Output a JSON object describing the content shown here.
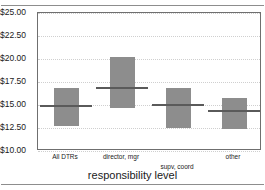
{
  "chart_data": {
    "type": "bar",
    "title": "",
    "xlabel": "responsibility level",
    "ylabel": "",
    "categories": [
      "All DTRs",
      "director, mgr",
      "supv, coord",
      "other"
    ],
    "ylim": [
      10.0,
      25.0
    ],
    "ytick_labels": [
      "$25.00",
      "$22.50",
      "$20.00",
      "$17.50",
      "$15.00",
      "$12.50",
      "$10.00"
    ],
    "ytick_values": [
      25.0,
      22.5,
      20.0,
      17.5,
      15.0,
      12.5,
      10.0
    ],
    "grid": true,
    "legend": "none",
    "series": [
      {
        "name": "wage range",
        "bars": [
          {
            "category": "All DTRs",
            "low": 12.75,
            "high": 16.85,
            "median": 14.9
          },
          {
            "category": "director, mgr",
            "low": 14.7,
            "high": 20.2,
            "median": 16.9
          },
          {
            "category": "supv, coord",
            "low": 12.45,
            "high": 16.85,
            "median": 15.0
          },
          {
            "category": "other",
            "low": 12.4,
            "high": 15.8,
            "median": 14.35
          }
        ]
      }
    ],
    "colors": {
      "bar_fill": "#8d8d8d",
      "median_line": "#5a5a5a",
      "frame": "#6f6f6f",
      "gridline": "#cfcfcf",
      "background": "#ffffff"
    }
  }
}
